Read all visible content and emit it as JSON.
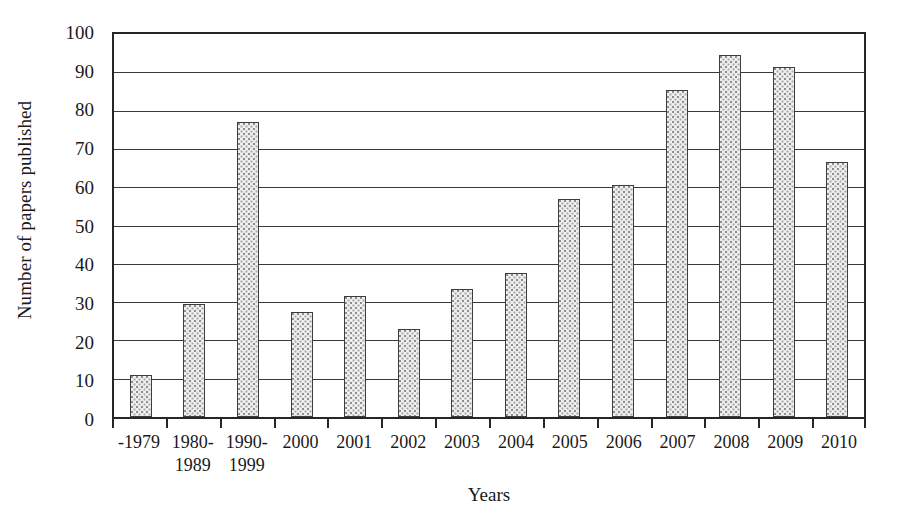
{
  "chart_data": {
    "type": "bar",
    "title": "",
    "xlabel": "Years",
    "ylabel": "Number of papers published",
    "categories": [
      "-1979",
      "1980-\n1989",
      "1990-\n1999",
      "2000",
      "2001",
      "2002",
      "2003",
      "2004",
      "2005",
      "2006",
      "2007",
      "2008",
      "2009",
      "2010"
    ],
    "values": [
      11,
      29.5,
      77,
      27.5,
      31.5,
      23,
      33.5,
      37.5,
      57,
      60.5,
      85.5,
      94.5,
      91.5,
      66.5
    ],
    "ylim": [
      0,
      100
    ],
    "y_ticks": [
      0,
      10,
      20,
      30,
      40,
      50,
      60,
      70,
      80,
      90,
      100
    ],
    "y_tick_labels": [
      "0",
      "10",
      "20",
      "30",
      "40",
      "50",
      "60",
      "70",
      "80",
      "90",
      "100"
    ],
    "grid": true,
    "grid_axis": "y",
    "legend": false,
    "bar_fill": "#efefef",
    "bar_edge": "#3d3d3d",
    "axis_color": "#262626",
    "background": "#ffffff"
  }
}
